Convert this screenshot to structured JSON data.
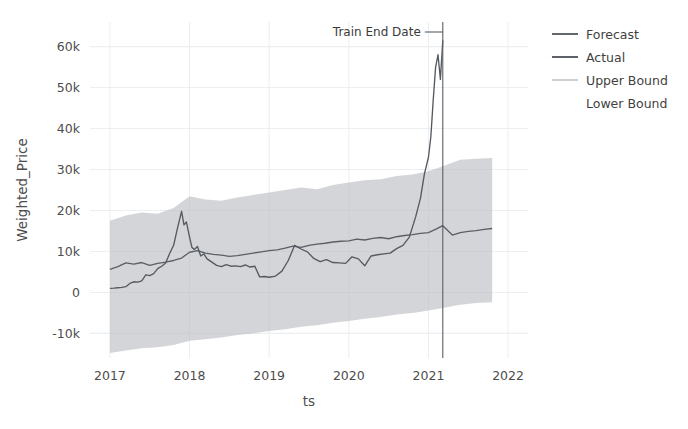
{
  "chart_data": {
    "type": "line",
    "title": "",
    "xlabel": "ts",
    "ylabel": "Weighted_Price",
    "xlim": [
      2016.75,
      2022.25
    ],
    "ylim": [
      -16000,
      66000
    ],
    "xticks": [
      "2017",
      "2018",
      "2019",
      "2020",
      "2021",
      "2022"
    ],
    "xtick_values": [
      2017,
      2018,
      2019,
      2020,
      2021,
      2022
    ],
    "yticks": [
      "-10k",
      "0",
      "10k",
      "20k",
      "30k",
      "40k",
      "50k",
      "60k"
    ],
    "ytick_values": [
      -10000,
      0,
      10000,
      20000,
      30000,
      40000,
      50000,
      60000
    ],
    "grid": true,
    "legend_position": "right",
    "colors": {
      "forecast": "#5a5f66",
      "actual": "#555a61",
      "band": "#b9bcc0",
      "background": "#ffffff",
      "grid": "#eceff1",
      "axis_text": "#4d4d4d",
      "annotation_line": "#5b5f64"
    },
    "annotations": [
      {
        "name": "train-end-date",
        "label": "Train End Date",
        "x_value": 2021.18
      }
    ],
    "legend": [
      {
        "label": "Forecast",
        "type": "line",
        "color": "#5a5f66"
      },
      {
        "label": "Actual",
        "type": "line",
        "color": "#555a61"
      },
      {
        "label": "Upper Bound",
        "type": "line",
        "color": "#c9ccd0"
      },
      {
        "label": "Lower Bound",
        "type": "line",
        "color": "#ffffff"
      }
    ],
    "series": [
      {
        "name": "Actual",
        "x": [
          2017.0,
          2017.05,
          2017.1,
          2017.15,
          2017.2,
          2017.25,
          2017.3,
          2017.35,
          2017.4,
          2017.45,
          2017.5,
          2017.55,
          2017.6,
          2017.65,
          2017.7,
          2017.75,
          2017.8,
          2017.85,
          2017.9,
          2017.93,
          2017.96,
          2018.0,
          2018.03,
          2018.06,
          2018.1,
          2018.14,
          2018.18,
          2018.22,
          2018.28,
          2018.34,
          2018.4,
          2018.46,
          2018.52,
          2018.58,
          2018.64,
          2018.7,
          2018.76,
          2018.82,
          2018.88,
          2018.94,
          2019.0,
          2019.08,
          2019.16,
          2019.24,
          2019.32,
          2019.4,
          2019.48,
          2019.56,
          2019.64,
          2019.72,
          2019.8,
          2019.88,
          2019.96,
          2020.04,
          2020.12,
          2020.2,
          2020.28,
          2020.36,
          2020.44,
          2020.52,
          2020.6,
          2020.68,
          2020.76,
          2020.84,
          2020.9,
          2020.95,
          2021.0,
          2021.03,
          2021.06,
          2021.09,
          2021.12,
          2021.15,
          2021.18
        ],
        "y": [
          1000,
          1050,
          1150,
          1250,
          1400,
          2200,
          2600,
          2500,
          2800,
          4300,
          4100,
          4600,
          5800,
          6400,
          7200,
          9500,
          11500,
          15800,
          19800,
          16500,
          17200,
          13500,
          11000,
          10500,
          11200,
          8900,
          9400,
          8200,
          7400,
          6600,
          6300,
          6800,
          6400,
          6500,
          6300,
          6700,
          6200,
          6400,
          3800,
          3900,
          3700,
          4000,
          5200,
          7800,
          11500,
          10600,
          9900,
          8300,
          7500,
          8000,
          7300,
          7200,
          7100,
          8700,
          8200,
          6500,
          8900,
          9200,
          9400,
          9600,
          10700,
          11500,
          13500,
          18500,
          23000,
          29000,
          33000,
          38000,
          47000,
          55000,
          58000,
          52000,
          61500
        ]
      },
      {
        "name": "Forecast",
        "x": [
          2017.0,
          2017.1,
          2017.2,
          2017.3,
          2017.4,
          2017.5,
          2017.6,
          2017.7,
          2017.8,
          2017.9,
          2018.0,
          2018.1,
          2018.2,
          2018.3,
          2018.4,
          2018.5,
          2018.6,
          2018.7,
          2018.8,
          2018.9,
          2019.0,
          2019.1,
          2019.2,
          2019.3,
          2019.4,
          2019.5,
          2019.6,
          2019.7,
          2019.8,
          2019.9,
          2020.0,
          2020.1,
          2020.2,
          2020.3,
          2020.4,
          2020.5,
          2020.6,
          2020.7,
          2020.8,
          2020.9,
          2021.0,
          2021.1,
          2021.18,
          2021.3,
          2021.4,
          2021.5,
          2021.6,
          2021.7,
          2021.8
        ],
        "y": [
          5600,
          6300,
          7200,
          6900,
          7300,
          6600,
          7100,
          7400,
          7800,
          8400,
          9800,
          10200,
          9600,
          9300,
          9100,
          8800,
          9000,
          9300,
          9600,
          9900,
          10200,
          10400,
          10800,
          11300,
          11000,
          11500,
          11800,
          12000,
          12300,
          12500,
          12600,
          13000,
          12800,
          13200,
          13400,
          13100,
          13600,
          13900,
          14100,
          14400,
          14600,
          15500,
          16300,
          14000,
          14600,
          14900,
          15100,
          15400,
          15600
        ]
      },
      {
        "name": "Upper Bound",
        "x": [
          2017.0,
          2017.2,
          2017.4,
          2017.6,
          2017.8,
          2018.0,
          2018.2,
          2018.4,
          2018.6,
          2018.8,
          2019.0,
          2019.2,
          2019.4,
          2019.6,
          2019.8,
          2020.0,
          2020.2,
          2020.4,
          2020.6,
          2020.8,
          2021.0,
          2021.18,
          2021.4,
          2021.6,
          2021.8
        ],
        "y": [
          17500,
          18800,
          19500,
          19200,
          20600,
          23500,
          22700,
          22400,
          23200,
          23800,
          24400,
          25000,
          25600,
          25200,
          26200,
          26800,
          27400,
          27600,
          28400,
          28800,
          29600,
          30800,
          32400,
          32600,
          32800
        ]
      },
      {
        "name": "Lower Bound",
        "x": [
          2017.0,
          2017.2,
          2017.4,
          2017.6,
          2017.8,
          2018.0,
          2018.2,
          2018.4,
          2018.6,
          2018.8,
          2019.0,
          2019.2,
          2019.4,
          2019.6,
          2019.8,
          2020.0,
          2020.2,
          2020.4,
          2020.6,
          2020.8,
          2021.0,
          2021.18,
          2021.4,
          2021.6,
          2021.8
        ],
        "y": [
          -14800,
          -14200,
          -13600,
          -13400,
          -12800,
          -11800,
          -11400,
          -11000,
          -10400,
          -10000,
          -9400,
          -9000,
          -8400,
          -8000,
          -7400,
          -7000,
          -6400,
          -6000,
          -5400,
          -5000,
          -4400,
          -3800,
          -3000,
          -2600,
          -2400
        ]
      }
    ]
  }
}
